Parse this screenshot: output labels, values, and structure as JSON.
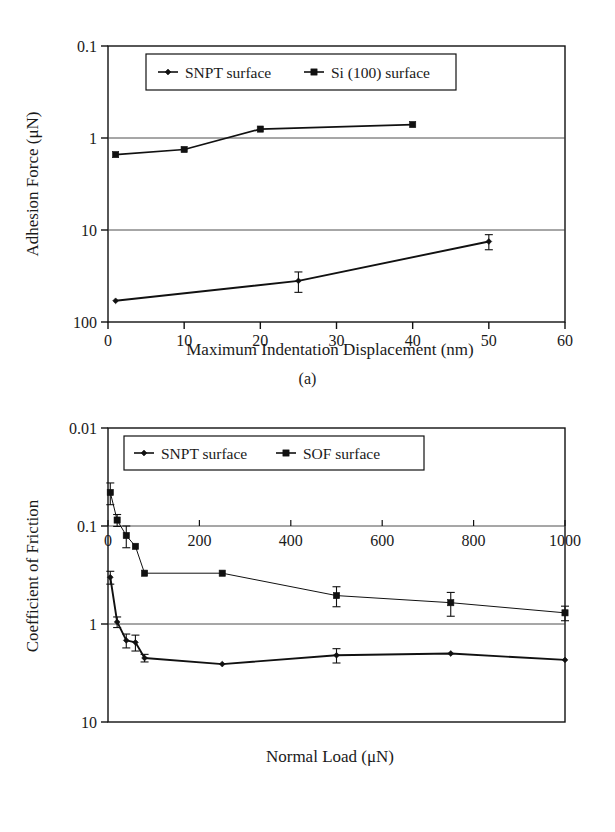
{
  "figure": {
    "panels": [
      {
        "caption": "(a)"
      },
      {
        "caption": "(b)"
      }
    ]
  },
  "panel_a": {
    "caption": "(a)",
    "y_axis_title": "Adhesion Force (μN)",
    "x_axis_title": "Maximum Indentation Displacement (nm)",
    "y_ticks": [
      "100",
      "10",
      "1",
      "0.1"
    ],
    "x_ticks": [
      "0",
      "10",
      "20",
      "30",
      "40",
      "50",
      "60"
    ],
    "legend": [
      {
        "label": "SNPT surface",
        "marker": "diamond"
      },
      {
        "label": "Si (100) surface",
        "marker": "square"
      }
    ]
  },
  "panel_b": {
    "caption": "(b)",
    "y_axis_title": "Coefficient of Friction",
    "x_axis_title": "Normal Load (μN)",
    "y_ticks": [
      "10",
      "1",
      "0.1",
      "0.01"
    ],
    "x_ticks": [
      "0",
      "200",
      "400",
      "600",
      "800",
      "1000"
    ],
    "legend": [
      {
        "label": "SNPT surface",
        "marker": "diamond"
      },
      {
        "label": "SOF surface",
        "marker": "square"
      }
    ]
  },
  "chart_data": [
    {
      "type": "line",
      "panel": "(a)",
      "title": "",
      "xlabel": "Maximum Indentation Displacement (nm)",
      "ylabel": "Adhesion Force (μN)",
      "xlim": [
        0,
        60
      ],
      "ylim": [
        0.1,
        100
      ],
      "yscale": "log",
      "xscale": "linear",
      "grid": true,
      "legend_position": "top-inside",
      "xticks": [
        0,
        10,
        20,
        30,
        40,
        50,
        60
      ],
      "yticks": [
        0.1,
        1,
        10,
        100
      ],
      "series": [
        {
          "name": "SNPT surface",
          "marker": "diamond",
          "x": [
            1,
            25,
            50
          ],
          "values": [
            0.17,
            0.28,
            0.75
          ],
          "yerr": [
            0.0,
            0.07,
            0.14
          ]
        },
        {
          "name": "Si (100) surface",
          "marker": "square",
          "x": [
            1,
            10,
            20,
            40
          ],
          "values": [
            6.6,
            7.5,
            12.5,
            14.0
          ],
          "yerr": [
            0.0,
            0.0,
            0.0,
            0.0
          ]
        }
      ]
    },
    {
      "type": "line",
      "panel": "(b)",
      "title": "",
      "xlabel": "Normal Load (μN)",
      "ylabel": "Coefficient of Friction",
      "xlim": [
        0,
        1000
      ],
      "ylim": [
        0.01,
        10
      ],
      "yscale": "log",
      "xscale": "linear",
      "grid": true,
      "legend_position": "top-inside",
      "xticks": [
        0,
        200,
        400,
        600,
        800,
        1000
      ],
      "yticks": [
        0.01,
        0.1,
        1,
        10
      ],
      "series": [
        {
          "name": "SNPT surface",
          "marker": "diamond",
          "x": [
            5,
            20,
            40,
            60,
            80,
            250,
            500,
            750,
            1000
          ],
          "values": [
            0.3,
            0.105,
            0.068,
            0.065,
            0.045,
            0.039,
            0.048,
            0.05,
            0.043
          ],
          "yerr": [
            0.045,
            0.013,
            0.011,
            0.012,
            0.004,
            0.0,
            0.008,
            0.0,
            0.0
          ]
        },
        {
          "name": "SOF surface",
          "marker": "square",
          "x": [
            5,
            20,
            40,
            60,
            80,
            250,
            500,
            750,
            1000
          ],
          "values": [
            2.2,
            1.15,
            0.8,
            0.62,
            0.33,
            0.33,
            0.195,
            0.165,
            0.13
          ],
          "yerr": [
            0.55,
            0.16,
            0.2,
            0.0,
            0.0,
            0.0,
            0.045,
            0.045,
            0.022
          ]
        }
      ]
    }
  ]
}
